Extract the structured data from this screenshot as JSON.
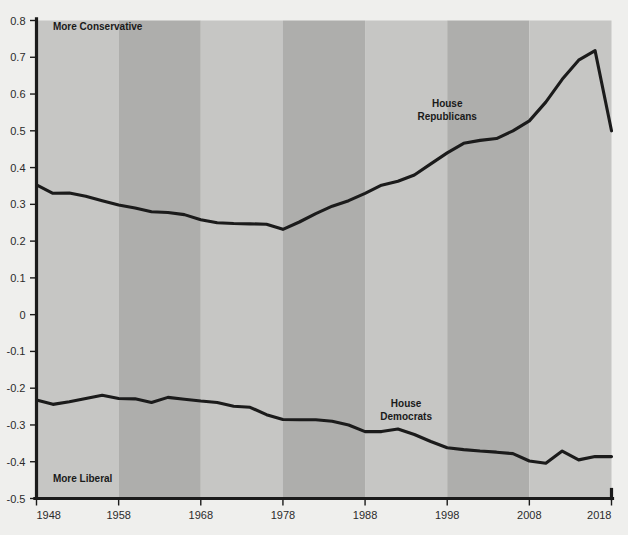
{
  "chart_data": {
    "type": "line",
    "title": "",
    "subtitle": "",
    "xlabel": "",
    "ylabel": "",
    "xlim": [
      1948,
      2018
    ],
    "ylim": [
      -0.5,
      0.8
    ],
    "grid": false,
    "legend_position": "inline-annotation",
    "annotations": [
      {
        "text": "More Conservative",
        "x": 1950,
        "y": 0.775,
        "align": "start"
      },
      {
        "text": "More Liberal",
        "x": 1950,
        "y": -0.455,
        "align": "start"
      }
    ],
    "y_ticks": [
      0.8,
      0.7,
      0.6,
      0.5,
      0.4,
      0.3,
      0.2,
      0.1,
      0,
      -0.1,
      -0.2,
      -0.3,
      -0.4,
      -0.5
    ],
    "y_tick_labels": [
      "0.8",
      "0.7",
      "0.6",
      "0.5",
      "0.4",
      "0.3",
      "0.2",
      "0.1",
      "0",
      "-0.1",
      "-0.2",
      "-0.3",
      "-0.4",
      "-0.5"
    ],
    "x_ticks": [
      1948,
      1958,
      1968,
      1978,
      1988,
      1998,
      2008,
      2018
    ],
    "x_tick_labels": [
      "1948",
      "1958",
      "1968",
      "1978",
      "1988",
      "1998",
      "2008",
      "2018"
    ],
    "bands": [
      {
        "start": 1948,
        "end": 1958,
        "shade": "light"
      },
      {
        "start": 1958,
        "end": 1968,
        "shade": "dark"
      },
      {
        "start": 1968,
        "end": 1978,
        "shade": "light"
      },
      {
        "start": 1978,
        "end": 1988,
        "shade": "dark"
      },
      {
        "start": 1988,
        "end": 1998,
        "shade": "light"
      },
      {
        "start": 1998,
        "end": 2008,
        "shade": "dark"
      },
      {
        "start": 2008,
        "end": 2018,
        "shade": "light"
      }
    ],
    "series": [
      {
        "name": "House Republicans",
        "label_x": 1998,
        "label_y": 0.565,
        "x": [
          1948,
          1950,
          1952,
          1954,
          1956,
          1958,
          1960,
          1962,
          1964,
          1966,
          1968,
          1970,
          1972,
          1974,
          1976,
          1978,
          1980,
          1982,
          1984,
          1986,
          1988,
          1990,
          1992,
          1994,
          1996,
          1998,
          2000,
          2002,
          2004,
          2006,
          2008,
          2010,
          2012,
          2014,
          2016,
          2018
        ],
        "values": [
          0.353,
          0.33,
          0.331,
          0.322,
          0.31,
          0.298,
          0.29,
          0.28,
          0.278,
          0.272,
          0.258,
          0.25,
          0.248,
          0.247,
          0.246,
          0.232,
          0.252,
          0.275,
          0.295,
          0.31,
          0.33,
          0.352,
          0.363,
          0.38,
          0.41,
          0.44,
          0.466,
          0.474,
          0.479,
          0.5,
          0.527,
          0.578,
          0.64,
          0.692,
          0.718,
          0.5
        ]
      },
      {
        "name": "House Democrats",
        "label_x": 1993,
        "label_y": -0.252,
        "x": [
          1948,
          1950,
          1952,
          1954,
          1956,
          1958,
          1960,
          1962,
          1964,
          1966,
          1968,
          1970,
          1972,
          1974,
          1976,
          1978,
          1980,
          1982,
          1984,
          1986,
          1988,
          1990,
          1992,
          1994,
          1996,
          1998,
          2000,
          2002,
          2004,
          2006,
          2008,
          2010,
          2012,
          2014,
          2016,
          2018
        ],
        "values": [
          -0.232,
          -0.244,
          -0.237,
          -0.228,
          -0.219,
          -0.228,
          -0.229,
          -0.239,
          -0.225,
          -0.23,
          -0.235,
          -0.239,
          -0.249,
          -0.252,
          -0.272,
          -0.285,
          -0.286,
          -0.286,
          -0.29,
          -0.3,
          -0.318,
          -0.318,
          -0.311,
          -0.326,
          -0.345,
          -0.362,
          -0.367,
          -0.371,
          -0.374,
          -0.378,
          -0.398,
          -0.404,
          -0.371,
          -0.395,
          -0.386,
          -0.386
        ]
      }
    ]
  },
  "colors": {
    "page_background": "#efefed",
    "band_light": "#c6c6c4",
    "band_dark": "#aeaeac",
    "line": "#1b1b1b",
    "axis": "#1b1b1b",
    "text": "#1c1c1c"
  }
}
